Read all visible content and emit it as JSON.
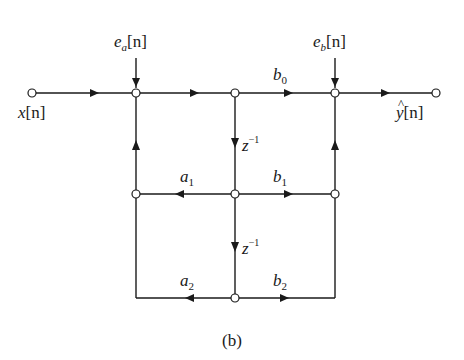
{
  "diagram": {
    "caption": "(b)",
    "type": "signal-flow-graph",
    "labels": {
      "input": {
        "base": "x",
        "idx": "[n]"
      },
      "output": {
        "hat": "^",
        "base": "y",
        "idx": "[n]"
      },
      "noise_a": {
        "base": "e",
        "sub": "a",
        "idx": "[n]"
      },
      "noise_b": {
        "base": "e",
        "sub": "b",
        "idx": "[n]"
      },
      "b0": {
        "base": "b",
        "sub": "0"
      },
      "b1": {
        "base": "b",
        "sub": "1"
      },
      "b2": {
        "base": "b",
        "sub": "2"
      },
      "a1": {
        "base": "a",
        "sub": "1"
      },
      "a2": {
        "base": "a",
        "sub": "2"
      },
      "delay1": {
        "base": "z",
        "sup": "−1"
      },
      "delay2": {
        "base": "z",
        "sup": "−1"
      }
    },
    "nodes": [
      {
        "id": "x_in",
        "x": 32,
        "y": 93
      },
      {
        "id": "sum_a",
        "x": 136,
        "y": 93
      },
      {
        "id": "w0",
        "x": 235,
        "y": 93
      },
      {
        "id": "sum_b",
        "x": 335,
        "y": 93
      },
      {
        "id": "y_out",
        "x": 436,
        "y": 93
      },
      {
        "id": "fb1",
        "x": 136,
        "y": 194
      },
      {
        "id": "w1",
        "x": 235,
        "y": 194
      },
      {
        "id": "ff1",
        "x": 335,
        "y": 194
      },
      {
        "id": "w2",
        "x": 235,
        "y": 298
      }
    ],
    "edges": [
      {
        "from": "x_in",
        "to": "sum_a",
        "gain": ""
      },
      {
        "from": "sum_a",
        "to": "w0",
        "gain": ""
      },
      {
        "from": "w0",
        "to": "sum_b",
        "gain": "b0"
      },
      {
        "from": "sum_b",
        "to": "y_out",
        "gain": ""
      },
      {
        "from": "w0",
        "to": "w1",
        "gain": "z^-1"
      },
      {
        "from": "w1",
        "to": "w2",
        "gain": "z^-1"
      },
      {
        "from": "w1",
        "to": "fb1",
        "gain": "a1"
      },
      {
        "from": "w1",
        "to": "ff1",
        "gain": "b1"
      },
      {
        "from": "w2",
        "to": "fb1",
        "gain": "a2"
      },
      {
        "from": "w2",
        "to": "ff1",
        "gain": "b2"
      },
      {
        "from": "fb1",
        "to": "sum_a",
        "gain": ""
      },
      {
        "from": "ff1",
        "to": "sum_b",
        "gain": ""
      }
    ]
  }
}
